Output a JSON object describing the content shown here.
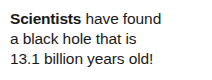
{
  "headline": {
    "lead_word": "Scientists",
    "line1_rest": " have found",
    "line2": "a black hole that is",
    "line3": "13.1 billion years old!",
    "full_text": "Scientists have found a black hole that is 13.1 billion years old!",
    "text_color": "#1a1a1a",
    "background_color": "#ffffff"
  }
}
